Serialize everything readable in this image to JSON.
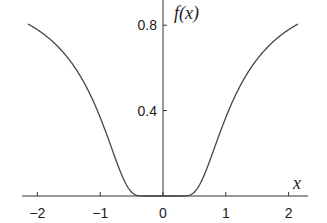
{
  "chart_data": {
    "type": "line",
    "title": "",
    "xlabel": "x",
    "ylabel": "f(x)",
    "function": "exp(-1/x^2)",
    "xlim": [
      -2.15,
      2.15
    ],
    "ylim": [
      0,
      0.8
    ],
    "x_ticks": [
      "−2",
      "−1",
      "0",
      "1",
      "2"
    ],
    "y_ticks": [
      "0.4",
      "0.8"
    ],
    "grid": false,
    "series": [
      {
        "name": "f(x)",
        "x": [
          -2.15,
          -2,
          -1.5,
          -1.25,
          -1,
          -0.75,
          -0.5,
          -0.4,
          -0.3,
          0,
          0.3,
          0.4,
          0.5,
          0.75,
          1,
          1.25,
          1.5,
          2,
          2.15
        ],
        "values": [
          0.805,
          0.779,
          0.641,
          0.527,
          0.368,
          0.169,
          0.018,
          0.002,
          0.0,
          0.0,
          0.0,
          0.002,
          0.018,
          0.169,
          0.368,
          0.527,
          0.641,
          0.779,
          0.805
        ]
      }
    ]
  }
}
